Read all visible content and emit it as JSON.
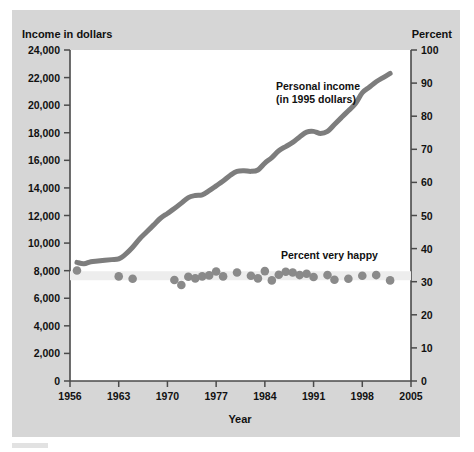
{
  "figure": {
    "background_color": "#d6d6d6",
    "plot_background_color": "#ffffff",
    "axis_color": "#4a4a4a"
  },
  "chart_data": {
    "type": "line",
    "title": "",
    "subtitle": "",
    "xlabel": "Year",
    "ylabel_left": "Income in dollars",
    "ylabel_right": "Percent",
    "grid": false,
    "legend_position": "inline-annotation",
    "xlim": [
      1956,
      2005
    ],
    "xticks": [
      "1956",
      "1963",
      "1970",
      "1977",
      "1984",
      "1991",
      "1998",
      "2005"
    ],
    "xtick_values": [
      1956,
      1963,
      1970,
      1977,
      1984,
      1991,
      1998,
      2005
    ],
    "ylim_left": [
      0,
      24000
    ],
    "yticks_left": [
      "0",
      "2,000",
      "4,000",
      "6,000",
      "8,000",
      "10,000",
      "12,000",
      "14,000",
      "16,000",
      "18,000",
      "20,000",
      "22,000",
      "24,000"
    ],
    "ytick_values_left": [
      0,
      2000,
      4000,
      6000,
      8000,
      10000,
      12000,
      14000,
      16000,
      18000,
      20000,
      22000,
      24000
    ],
    "ylim_right": [
      0,
      100
    ],
    "yticks_right": [
      "0",
      "10",
      "20",
      "30",
      "40",
      "50",
      "60",
      "70",
      "80",
      "90",
      "100"
    ],
    "ytick_values_right": [
      0,
      10,
      20,
      30,
      40,
      50,
      60,
      70,
      80,
      90,
      100
    ],
    "annotations": [
      {
        "id": "income-annotation",
        "text_line1": "Personal income",
        "text_line2": "(in 1995 dollars)",
        "x": 1979.5,
        "y_left": 21300
      },
      {
        "id": "happy-annotation",
        "text_line1": "Percent very happy",
        "text_line2": "",
        "x": 1988.5,
        "y_right": 36.5
      }
    ],
    "series": [
      {
        "name": "Personal income (in 1995 dollars)",
        "axis": "left",
        "type": "line",
        "color": "#7d7d7d",
        "linewidth": 5,
        "x": [
          1957,
          1958,
          1959,
          1960,
          1961,
          1962,
          1963,
          1964,
          1965,
          1966,
          1967,
          1968,
          1969,
          1970,
          1971,
          1972,
          1973,
          1974,
          1975,
          1976,
          1977,
          1978,
          1979,
          1980,
          1981,
          1982,
          1983,
          1984,
          1985,
          1986,
          1987,
          1988,
          1989,
          1990,
          1991,
          1992,
          1993,
          1994,
          1995,
          1996,
          1997,
          1998,
          1999,
          2000,
          2001,
          2002
        ],
        "values": [
          8600,
          8500,
          8650,
          8700,
          8750,
          8800,
          8850,
          9200,
          9700,
          10300,
          10800,
          11300,
          11800,
          12150,
          12500,
          12900,
          13300,
          13450,
          13500,
          13800,
          14150,
          14500,
          14900,
          15200,
          15250,
          15200,
          15300,
          15800,
          16200,
          16700,
          17000,
          17300,
          17700,
          18050,
          18100,
          17950,
          18100,
          18600,
          19100,
          19600,
          20100,
          20900,
          21300,
          21700,
          22000,
          22300
        ]
      },
      {
        "name": "Percent very happy",
        "axis": "right",
        "type": "scatter",
        "color": "#8a8a8a",
        "marker_size": 9,
        "band_color": "#ededed",
        "x": [
          1957,
          1963,
          1965,
          1971,
          1972,
          1973,
          1974,
          1975,
          1976,
          1977,
          1978,
          1980,
          1982,
          1983,
          1984,
          1985,
          1986,
          1987,
          1988,
          1989,
          1990,
          1991,
          1993,
          1994,
          1996,
          1998,
          2000,
          2002
        ],
        "values": [
          33.4,
          31.6,
          30.9,
          30.5,
          29.0,
          31.5,
          31.0,
          31.6,
          31.9,
          33.1,
          31.6,
          32.8,
          31.8,
          31.0,
          33.2,
          30.4,
          32.1,
          33.0,
          32.8,
          32.0,
          32.4,
          31.4,
          32.0,
          30.6,
          30.9,
          31.8,
          32.0,
          30.4
        ]
      }
    ]
  }
}
